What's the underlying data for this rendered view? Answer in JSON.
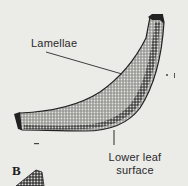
{
  "figure": {
    "panel_letter": "B",
    "labels": {
      "lamellae": "Lamellae",
      "lower_leaf_surface_line1": "Lower leaf",
      "lower_leaf_surface_line2": "surface"
    },
    "colors": {
      "background": "#ebebe8",
      "tissue_dark": "#2b2b2b",
      "tissue_mid": "#8a8a8a",
      "tissue_light": "#c9c9c6",
      "label_text": "#2a2a2a"
    }
  }
}
